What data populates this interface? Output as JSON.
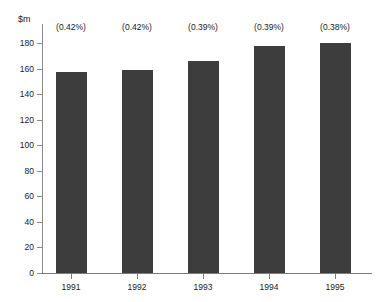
{
  "chart_data": {
    "type": "bar",
    "title": "",
    "subtitle": "",
    "xlabel": "",
    "ylabel": "$m",
    "categories": [
      "1991",
      "1992",
      "1993",
      "1994",
      "1995"
    ],
    "values": [
      157,
      159,
      166,
      178,
      180
    ],
    "series": [
      {
        "name": "",
        "values": [
          157,
          159,
          166,
          178,
          180
        ]
      }
    ],
    "annotations": [
      "(0.42%)",
      "(0.42%)",
      "(0.39%)",
      "(0.39%)",
      "(0.38%)"
    ],
    "ylim": [
      0,
      180
    ],
    "y_ticks": [
      0,
      20,
      40,
      60,
      80,
      100,
      120,
      140,
      160,
      180
    ],
    "y_tick_labels": [
      "0",
      "20",
      "40",
      "60",
      "80",
      "100",
      "120",
      "140",
      "160",
      "180"
    ],
    "grid": false,
    "legend": false,
    "legend_position": "none",
    "bar_color": "#3d3d3d",
    "background_color": "#ffffff",
    "axis_color": "#7a7a7a"
  }
}
